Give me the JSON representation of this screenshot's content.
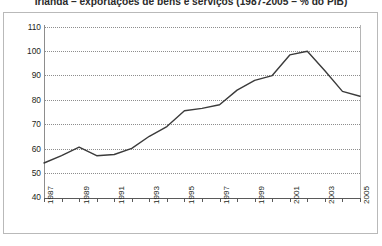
{
  "chart_data": {
    "type": "line",
    "title": "Irlanda – exportações de bens e serviços (1987-2005 – % do PIB)",
    "xlabel": "",
    "ylabel": "",
    "ylim": [
      40,
      110
    ],
    "ytick_step": 10,
    "yticks": [
      "110",
      "100",
      "90",
      "80",
      "70",
      "60",
      "50",
      "40"
    ],
    "grid": true,
    "legend": "none",
    "x": [
      1987,
      1988,
      1989,
      1990,
      1991,
      1992,
      1993,
      1994,
      1995,
      1996,
      1997,
      1998,
      1999,
      2000,
      2001,
      2002,
      2003,
      2004,
      2005
    ],
    "xtick_labels": [
      "1987",
      "",
      "1989",
      "",
      "1991",
      "",
      "1993",
      "",
      "1995",
      "",
      "1997",
      "",
      "1999",
      "",
      "2001",
      "",
      "2003",
      "",
      "2005"
    ],
    "xticklabels_rotation": -90,
    "series": [
      {
        "name": "exportações de bens e serviços (% do PIB)",
        "color": "#3b3b3b",
        "values": [
          54,
          57,
          60.5,
          57,
          57.5,
          60,
          65,
          69,
          75.5,
          76.5,
          78,
          84,
          88,
          90,
          98.5,
          100,
          92,
          83.5,
          81.5
        ]
      }
    ]
  },
  "axes": {
    "y_labels": [
      {
        "value": "110",
        "y": 27
      },
      {
        "value": "100",
        "y": 51
      },
      {
        "value": "90",
        "y": 75
      },
      {
        "value": "80",
        "y": 100
      },
      {
        "value": "70",
        "y": 124
      },
      {
        "value": "60",
        "y": 149
      },
      {
        "value": "50",
        "y": 173
      },
      {
        "value": "40",
        "y": 197
      }
    ]
  },
  "colors": {
    "line": "#3b3b3b",
    "grid": "#8d8d8d",
    "axis": "#5a5a5a",
    "frame": "#b9b9b9",
    "text": "#231f20",
    "background": "#ffffff"
  }
}
